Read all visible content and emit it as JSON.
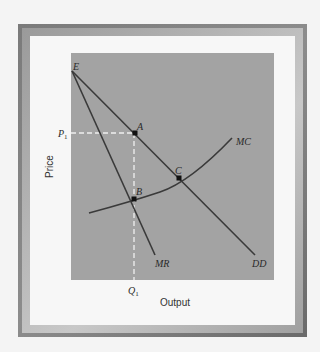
{
  "diagram": {
    "axes": {
      "x_label": "Output",
      "y_label": "Price"
    },
    "points": {
      "E": "E",
      "A": "A",
      "B": "B",
      "C": "C"
    },
    "curves": {
      "demand": "DD",
      "marginal_revenue": "MR",
      "marginal_cost": "MC"
    },
    "guides": {
      "price": "P",
      "price_sub": "1",
      "quantity": "Q",
      "quantity_sub": "1"
    },
    "colors": {
      "plot_background": "#a3a3a3",
      "curve": "#3a3a3a",
      "guide": "#f2f2f2",
      "frame": "#7a7a7a"
    }
  }
}
